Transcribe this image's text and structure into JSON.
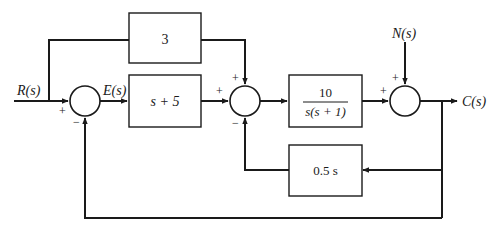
{
  "diagram": {
    "type": "control-system-block-diagram",
    "signals": {
      "input": "R(s)",
      "error": "E(s)",
      "disturbance": "N(s)",
      "output": "C(s)"
    },
    "blocks": {
      "feedforward": "3",
      "controller": "s + 5",
      "plant_numerator": "10",
      "plant_denominator": "s(s + 1)",
      "rate_feedback": "0.5 s"
    },
    "summing_junctions": [
      {
        "id": "sum1",
        "signs": {
          "left": "+",
          "bottom": "−"
        }
      },
      {
        "id": "sum2",
        "signs": {
          "top": "+",
          "left": "+",
          "bottom": "−"
        }
      },
      {
        "id": "sum3",
        "signs": {
          "top": "+",
          "left": "+"
        }
      }
    ],
    "colors": {
      "line": "#1a1a1a",
      "background": "#ffffff"
    }
  }
}
